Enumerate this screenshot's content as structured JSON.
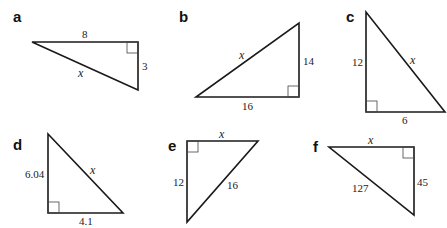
{
  "problems": [
    {
      "label": "a",
      "sides": {
        "top": "8",
        "right": "3",
        "hyp": "x"
      }
    },
    {
      "label": "b",
      "sides": {
        "hyp": "x",
        "right": "14",
        "bottom": "16"
      }
    },
    {
      "label": "c",
      "sides": {
        "left": "12",
        "hyp": "x",
        "bottom": "6"
      }
    },
    {
      "label": "d",
      "sides": {
        "left": "6.04",
        "hyp": "x",
        "bottom": "4.1"
      }
    },
    {
      "label": "e",
      "sides": {
        "top": "x",
        "left": "12",
        "hyp": "16"
      }
    },
    {
      "label": "f",
      "sides": {
        "top": "x",
        "hyp": "127",
        "right": "45"
      }
    }
  ]
}
